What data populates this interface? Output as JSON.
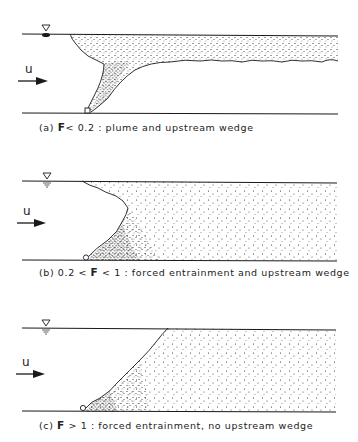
{
  "figure": {
    "panels": [
      {
        "id": "a",
        "caption_prefix": "(a)",
        "caption_symbol": "F",
        "caption_condition": "< 0.2 :",
        "caption_desc": "plume and upstream wedge",
        "flow_label": "u"
      },
      {
        "id": "b",
        "caption_prefix": "(b) 0.2 <",
        "caption_symbol": "F",
        "caption_condition": "< 1 :",
        "caption_desc": "forced entrainment and upstream wedge",
        "flow_label": "u"
      },
      {
        "id": "c",
        "caption_prefix": "(c)",
        "caption_symbol": "F",
        "caption_condition": "> 1 :",
        "caption_desc": "forced entrainment, no upstream wedge",
        "flow_label": "u"
      }
    ],
    "colors": {
      "ink": "#1a1a1a",
      "background": "#ffffff"
    }
  }
}
